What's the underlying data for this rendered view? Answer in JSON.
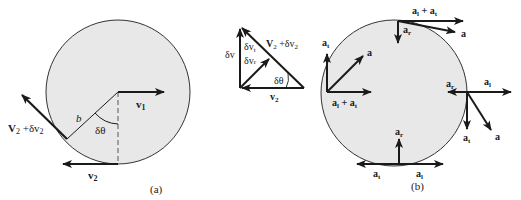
{
  "figure": {
    "panel_a": {
      "caption": "(a)",
      "labels": {
        "v1": "v",
        "v1_sub": "1",
        "v2": "v",
        "v2_sub": "2",
        "v2_plus": "V",
        "v2_plus_sub": "2",
        "v2_plus_mid": " +δv",
        "v2_plus_sub2": "2",
        "radius": "b",
        "angle": "δθ"
      }
    },
    "triangle": {
      "labels": {
        "dv": "δv",
        "dvt": "δv",
        "dvt_sub": "t",
        "dvr": "δv",
        "dvr_sub": "r",
        "hyp": "V",
        "hyp_sub": "2",
        "hyp_mid": " +δv",
        "hyp_sub2": "2",
        "angle": "δθ",
        "base": "v",
        "base_sub": "2"
      }
    },
    "panel_b": {
      "caption": "(b)",
      "labels": {
        "top_sum": "a",
        "top_sum_sub": "l",
        "top_sum_mid": " + a",
        "top_sum_sub2": "t",
        "top_ar": "a",
        "top_ar_sub": "r",
        "top_a": "a",
        "left_at": "a",
        "left_at_sub": "t",
        "left_a": "a",
        "left_sum": "a",
        "left_sum_sub": "l",
        "left_sum_mid": " + a",
        "left_sum_sub2": "t",
        "right_ar": "a",
        "right_ar_sub": "r",
        "right_al": "a",
        "right_al_sub": "l",
        "right_at": "a",
        "right_at_sub": "t",
        "right_a": "a",
        "bottom_ar": "a",
        "bottom_ar_sub": "r",
        "bottom_left": "a",
        "bottom_left_sub": "t",
        "bottom_right": "a",
        "bottom_right_sub": "l"
      }
    },
    "colors": {
      "circle_fill": "#e8e8e8",
      "stroke": "#1a1a1a"
    }
  }
}
